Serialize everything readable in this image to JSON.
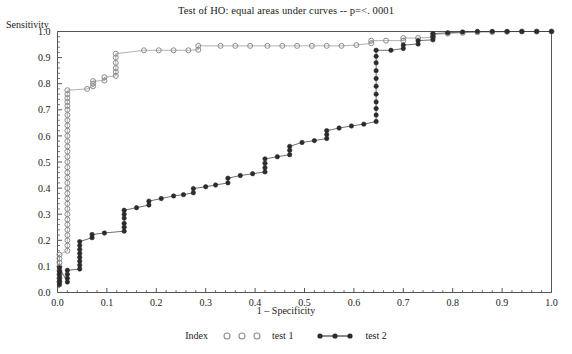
{
  "chart_data": {
    "type": "line",
    "title": "Test of HO: equal areas under curves -- p=<. 0001",
    "xlabel": "1 – Specificity",
    "ylabel": "Sensitivity",
    "xlim": [
      0.0,
      1.0
    ],
    "ylim": [
      0.0,
      1.0
    ],
    "grid": false,
    "legend_position": "bottom",
    "legend_title": "Index",
    "x_ticks": [
      "0.0",
      "0.1",
      "0.2",
      "0.3",
      "0.4",
      "0.5",
      "0.6",
      "0.7",
      "0.8",
      "0.9",
      "1.0"
    ],
    "y_ticks": [
      "0.0",
      "0.1",
      "0.2",
      "0.3",
      "0.4",
      "0.5",
      "0.6",
      "0.7",
      "0.8",
      "0.9",
      "1.0"
    ],
    "x_tick_values": [
      0.0,
      0.1,
      0.2,
      0.3,
      0.4,
      0.5,
      0.6,
      0.7,
      0.8,
      0.9,
      1.0
    ],
    "y_tick_values": [
      0.0,
      0.1,
      0.2,
      0.3,
      0.4,
      0.5,
      0.6,
      0.7,
      0.8,
      0.9,
      1.0
    ],
    "series": [
      {
        "name": "test 1",
        "marker": "open-circle",
        "color": "#8c8c8c",
        "points": [
          [
            0.004,
            0.04
          ],
          [
            0.004,
            0.055
          ],
          [
            0.004,
            0.07
          ],
          [
            0.004,
            0.085
          ],
          [
            0.004,
            0.1
          ],
          [
            0.004,
            0.115
          ],
          [
            0.004,
            0.13
          ],
          [
            0.004,
            0.145
          ],
          [
            0.02,
            0.16
          ],
          [
            0.02,
            0.18
          ],
          [
            0.02,
            0.2
          ],
          [
            0.02,
            0.22
          ],
          [
            0.02,
            0.24
          ],
          [
            0.02,
            0.26
          ],
          [
            0.02,
            0.28
          ],
          [
            0.02,
            0.3
          ],
          [
            0.02,
            0.32
          ],
          [
            0.02,
            0.34
          ],
          [
            0.02,
            0.36
          ],
          [
            0.02,
            0.38
          ],
          [
            0.02,
            0.4
          ],
          [
            0.02,
            0.42
          ],
          [
            0.02,
            0.44
          ],
          [
            0.02,
            0.46
          ],
          [
            0.02,
            0.48
          ],
          [
            0.02,
            0.5
          ],
          [
            0.02,
            0.52
          ],
          [
            0.02,
            0.54
          ],
          [
            0.02,
            0.56
          ],
          [
            0.02,
            0.58
          ],
          [
            0.02,
            0.6
          ],
          [
            0.02,
            0.62
          ],
          [
            0.02,
            0.64
          ],
          [
            0.02,
            0.66
          ],
          [
            0.02,
            0.68
          ],
          [
            0.02,
            0.7
          ],
          [
            0.02,
            0.715
          ],
          [
            0.02,
            0.73
          ],
          [
            0.02,
            0.745
          ],
          [
            0.02,
            0.76
          ],
          [
            0.02,
            0.775
          ],
          [
            0.06,
            0.78
          ],
          [
            0.072,
            0.79
          ],
          [
            0.072,
            0.8
          ],
          [
            0.072,
            0.81
          ],
          [
            0.095,
            0.812
          ],
          [
            0.095,
            0.825
          ],
          [
            0.118,
            0.83
          ],
          [
            0.118,
            0.845
          ],
          [
            0.118,
            0.86
          ],
          [
            0.118,
            0.88
          ],
          [
            0.118,
            0.9
          ],
          [
            0.118,
            0.915
          ],
          [
            0.175,
            0.928
          ],
          [
            0.205,
            0.928
          ],
          [
            0.235,
            0.928
          ],
          [
            0.265,
            0.928
          ],
          [
            0.285,
            0.93
          ],
          [
            0.285,
            0.945
          ],
          [
            0.33,
            0.945
          ],
          [
            0.36,
            0.945
          ],
          [
            0.39,
            0.945
          ],
          [
            0.425,
            0.945
          ],
          [
            0.455,
            0.945
          ],
          [
            0.485,
            0.945
          ],
          [
            0.515,
            0.945
          ],
          [
            0.545,
            0.945
          ],
          [
            0.575,
            0.945
          ],
          [
            0.605,
            0.948
          ],
          [
            0.635,
            0.955
          ],
          [
            0.635,
            0.965
          ],
          [
            0.665,
            0.965
          ],
          [
            0.7,
            0.965
          ],
          [
            0.7,
            0.975
          ],
          [
            0.73,
            0.975
          ],
          [
            0.76,
            0.978
          ],
          [
            0.76,
            0.988
          ],
          [
            0.79,
            0.992
          ],
          [
            0.82,
            0.995
          ],
          [
            0.85,
            0.997
          ],
          [
            0.88,
            0.998
          ],
          [
            0.91,
            0.999
          ],
          [
            0.94,
            1.0
          ],
          [
            0.97,
            1.0
          ],
          [
            1.0,
            1.0
          ]
        ]
      },
      {
        "name": "test 2",
        "marker": "filled-circle",
        "color": "#2b2b2b",
        "points": [
          [
            0.004,
            0.03
          ],
          [
            0.004,
            0.042
          ],
          [
            0.004,
            0.055
          ],
          [
            0.004,
            0.068
          ],
          [
            0.004,
            0.08
          ],
          [
            0.004,
            0.095
          ],
          [
            0.02,
            0.04
          ],
          [
            0.02,
            0.055
          ],
          [
            0.02,
            0.07
          ],
          [
            0.02,
            0.085
          ],
          [
            0.045,
            0.09
          ],
          [
            0.045,
            0.105
          ],
          [
            0.045,
            0.12
          ],
          [
            0.045,
            0.135
          ],
          [
            0.045,
            0.15
          ],
          [
            0.045,
            0.165
          ],
          [
            0.045,
            0.18
          ],
          [
            0.045,
            0.195
          ],
          [
            0.07,
            0.21
          ],
          [
            0.07,
            0.222
          ],
          [
            0.095,
            0.228
          ],
          [
            0.135,
            0.235
          ],
          [
            0.135,
            0.25
          ],
          [
            0.135,
            0.265
          ],
          [
            0.135,
            0.285
          ],
          [
            0.135,
            0.3
          ],
          [
            0.135,
            0.315
          ],
          [
            0.16,
            0.325
          ],
          [
            0.185,
            0.335
          ],
          [
            0.185,
            0.35
          ],
          [
            0.21,
            0.36
          ],
          [
            0.235,
            0.37
          ],
          [
            0.255,
            0.375
          ],
          [
            0.275,
            0.382
          ],
          [
            0.275,
            0.398
          ],
          [
            0.3,
            0.405
          ],
          [
            0.32,
            0.412
          ],
          [
            0.345,
            0.42
          ],
          [
            0.345,
            0.438
          ],
          [
            0.37,
            0.448
          ],
          [
            0.395,
            0.455
          ],
          [
            0.42,
            0.462
          ],
          [
            0.42,
            0.478
          ],
          [
            0.42,
            0.495
          ],
          [
            0.42,
            0.512
          ],
          [
            0.445,
            0.52
          ],
          [
            0.47,
            0.528
          ],
          [
            0.47,
            0.545
          ],
          [
            0.47,
            0.56
          ],
          [
            0.495,
            0.575
          ],
          [
            0.52,
            0.582
          ],
          [
            0.545,
            0.59
          ],
          [
            0.545,
            0.605
          ],
          [
            0.545,
            0.62
          ],
          [
            0.57,
            0.63
          ],
          [
            0.595,
            0.638
          ],
          [
            0.62,
            0.645
          ],
          [
            0.645,
            0.655
          ],
          [
            0.645,
            0.68
          ],
          [
            0.645,
            0.705
          ],
          [
            0.645,
            0.73
          ],
          [
            0.645,
            0.76
          ],
          [
            0.645,
            0.79
          ],
          [
            0.645,
            0.82
          ],
          [
            0.645,
            0.85
          ],
          [
            0.645,
            0.88
          ],
          [
            0.645,
            0.905
          ],
          [
            0.645,
            0.928
          ],
          [
            0.675,
            0.928
          ],
          [
            0.7,
            0.935
          ],
          [
            0.7,
            0.948
          ],
          [
            0.73,
            0.952
          ],
          [
            0.73,
            0.965
          ],
          [
            0.76,
            0.968
          ],
          [
            0.76,
            0.98
          ],
          [
            0.76,
            0.992
          ],
          [
            0.79,
            0.995
          ],
          [
            0.82,
            0.998
          ],
          [
            0.85,
            1.0
          ],
          [
            0.88,
            1.0
          ],
          [
            0.91,
            1.0
          ],
          [
            0.94,
            1.0
          ],
          [
            0.97,
            1.0
          ],
          [
            1.0,
            1.0
          ]
        ]
      }
    ]
  }
}
